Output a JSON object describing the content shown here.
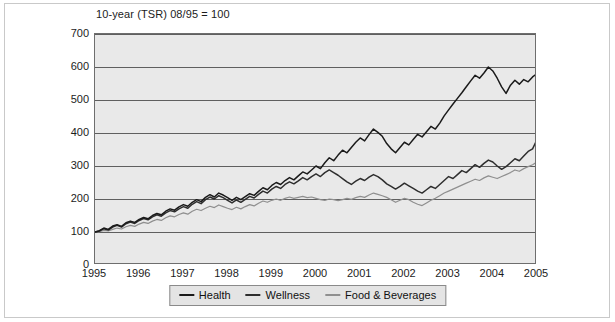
{
  "figure": {
    "title": "10-year (TSR) 08/95 = 100",
    "background": "#ffffff",
    "frame_color": "#c9c9c9",
    "plot_background": "#e9e9e9"
  },
  "legend": {
    "position": "bottom-center",
    "entries": [
      {
        "label": "Health",
        "color": "#1a1a1a"
      },
      {
        "label": "Wellness",
        "color": "#2e2e2e"
      },
      {
        "label": "Food & Beverages",
        "color": "#8f8f8f"
      }
    ]
  },
  "axes": {
    "y_ticks": [
      "0",
      "100",
      "200",
      "300",
      "400",
      "500",
      "600",
      "700"
    ],
    "x_ticks": [
      "1995",
      "1996",
      "1997",
      "1998",
      "1999",
      "2000",
      "2001",
      "2002",
      "2003",
      "2004",
      "2005"
    ]
  },
  "chart_data": {
    "type": "line",
    "title": "10-year (TSR) 08/95 = 100",
    "xlabel": "",
    "ylabel": "",
    "xlim": [
      1995,
      2005
    ],
    "ylim": [
      0,
      700
    ],
    "grid": true,
    "legend_position": "bottom-center",
    "x": [
      1995.0,
      1995.1,
      1995.2,
      1995.3,
      1995.4,
      1995.5,
      1995.6,
      1995.7,
      1995.8,
      1995.9,
      1996.0,
      1996.1,
      1996.2,
      1996.3,
      1996.4,
      1996.5,
      1996.6,
      1996.7,
      1996.8,
      1996.9,
      1997.0,
      1997.1,
      1997.2,
      1997.3,
      1997.4,
      1997.5,
      1997.6,
      1997.7,
      1997.8,
      1997.9,
      1998.0,
      1998.1,
      1998.2,
      1998.3,
      1998.4,
      1998.5,
      1998.6,
      1998.7,
      1998.8,
      1998.9,
      1999.0,
      1999.1,
      1999.2,
      1999.3,
      1999.4,
      1999.5,
      1999.6,
      1999.7,
      1999.8,
      1999.9,
      2000.0,
      2000.1,
      2000.2,
      2000.3,
      2000.4,
      2000.5,
      2000.6,
      2000.7,
      2000.8,
      2000.9,
      2001.0,
      2001.1,
      2001.2,
      2001.3,
      2001.4,
      2001.5,
      2001.6,
      2001.7,
      2001.8,
      2001.9,
      2002.0,
      2002.1,
      2002.2,
      2002.3,
      2002.4,
      2002.5,
      2002.6,
      2002.7,
      2002.8,
      2002.9,
      2003.0,
      2003.1,
      2003.2,
      2003.3,
      2003.4,
      2003.5,
      2003.6,
      2003.7,
      2003.8,
      2003.9,
      2004.0,
      2004.1,
      2004.2,
      2004.3,
      2004.4,
      2004.5,
      2004.6,
      2004.7,
      2004.8,
      2004.9,
      2005.0
    ],
    "series": [
      {
        "name": "Health",
        "color": "#1a1a1a",
        "values": [
          100,
          104,
          112,
          108,
          118,
          122,
          117,
          128,
          133,
          129,
          138,
          144,
          140,
          150,
          156,
          152,
          163,
          170,
          166,
          176,
          183,
          178,
          190,
          198,
          192,
          205,
          213,
          206,
          218,
          212,
          204,
          196,
          205,
          198,
          207,
          216,
          211,
          223,
          234,
          228,
          241,
          250,
          244,
          256,
          265,
          258,
          270,
          282,
          276,
          288,
          300,
          292,
          310,
          325,
          316,
          333,
          348,
          340,
          356,
          372,
          385,
          376,
          395,
          412,
          402,
          390,
          368,
          352,
          340,
          356,
          372,
          364,
          380,
          396,
          388,
          404,
          420,
          412,
          430,
          452,
          470,
          488,
          505,
          522,
          540,
          558,
          575,
          566,
          582,
          600,
          588,
          566,
          540,
          520,
          545,
          560,
          548,
          562,
          555,
          570,
          580
        ]
      },
      {
        "name": "Wellness",
        "color": "#2e2e2e",
        "values": [
          100,
          103,
          110,
          106,
          115,
          120,
          115,
          125,
          130,
          126,
          135,
          141,
          137,
          146,
          152,
          148,
          158,
          165,
          161,
          170,
          177,
          172,
          184,
          192,
          186,
          198,
          206,
          200,
          210,
          204,
          196,
          188,
          197,
          190,
          199,
          208,
          203,
          214,
          224,
          218,
          230,
          238,
          232,
          244,
          252,
          246,
          255,
          265,
          258,
          268,
          276,
          268,
          280,
          288,
          280,
          272,
          262,
          252,
          244,
          254,
          262,
          256,
          266,
          274,
          268,
          258,
          246,
          238,
          230,
          238,
          248,
          240,
          232,
          224,
          218,
          228,
          238,
          232,
          244,
          256,
          268,
          262,
          274,
          286,
          280,
          292,
          304,
          296,
          308,
          318,
          312,
          300,
          290,
          298,
          310,
          322,
          316,
          330,
          344,
          352,
          380
        ]
      },
      {
        "name": "Food & Beverages",
        "color": "#8f8f8f",
        "values": [
          100,
          101,
          105,
          103,
          108,
          112,
          109,
          116,
          120,
          117,
          124,
          129,
          126,
          133,
          138,
          135,
          143,
          149,
          146,
          153,
          158,
          154,
          163,
          169,
          165,
          172,
          178,
          174,
          182,
          177,
          172,
          168,
          175,
          170,
          177,
          183,
          179,
          187,
          194,
          190,
          196,
          200,
          196,
          202,
          206,
          202,
          205,
          208,
          204,
          206,
          202,
          198,
          196,
          200,
          198,
          195,
          198,
          202,
          199,
          204,
          208,
          205,
          212,
          218,
          214,
          210,
          205,
          198,
          190,
          196,
          202,
          198,
          190,
          184,
          180,
          188,
          196,
          202,
          210,
          218,
          224,
          230,
          236,
          242,
          248,
          254,
          260,
          256,
          264,
          270,
          266,
          262,
          268,
          274,
          280,
          288,
          284,
          292,
          298,
          304,
          312
        ]
      }
    ]
  }
}
